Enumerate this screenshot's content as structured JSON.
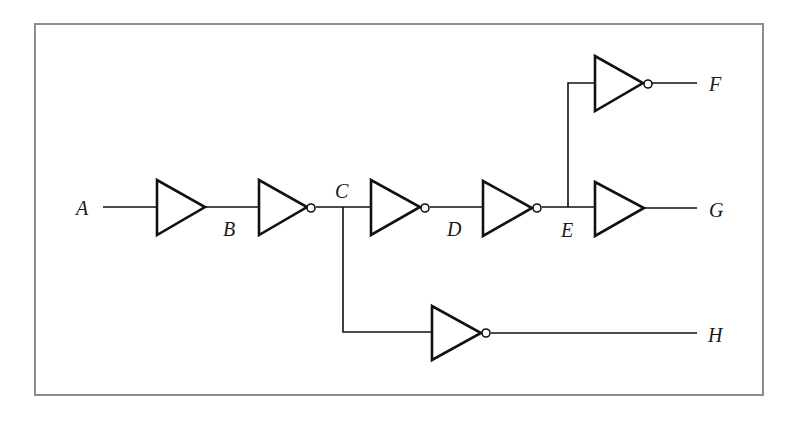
{
  "diagram": {
    "type": "logic-circuit",
    "frame_color": "#8c8c8c",
    "line_color": "#111111",
    "nodes": {
      "A": "A",
      "B": "B",
      "C": "C",
      "D": "D",
      "E": "E",
      "F": "F",
      "G": "G",
      "H": "H"
    },
    "gates": [
      {
        "id": "g1",
        "type": "buffer",
        "input": "A",
        "output": "B"
      },
      {
        "id": "g2",
        "type": "inverter",
        "input": "B",
        "output": "C"
      },
      {
        "id": "g3",
        "type": "inverter",
        "input": "C",
        "output": "D"
      },
      {
        "id": "g4",
        "type": "inverter",
        "input": "D",
        "output": "E"
      },
      {
        "id": "g5",
        "type": "inverter",
        "input": "E",
        "output": "F"
      },
      {
        "id": "g6",
        "type": "buffer",
        "input": "E",
        "output": "G"
      },
      {
        "id": "g7",
        "type": "inverter",
        "input": "C",
        "output": "H"
      }
    ]
  }
}
